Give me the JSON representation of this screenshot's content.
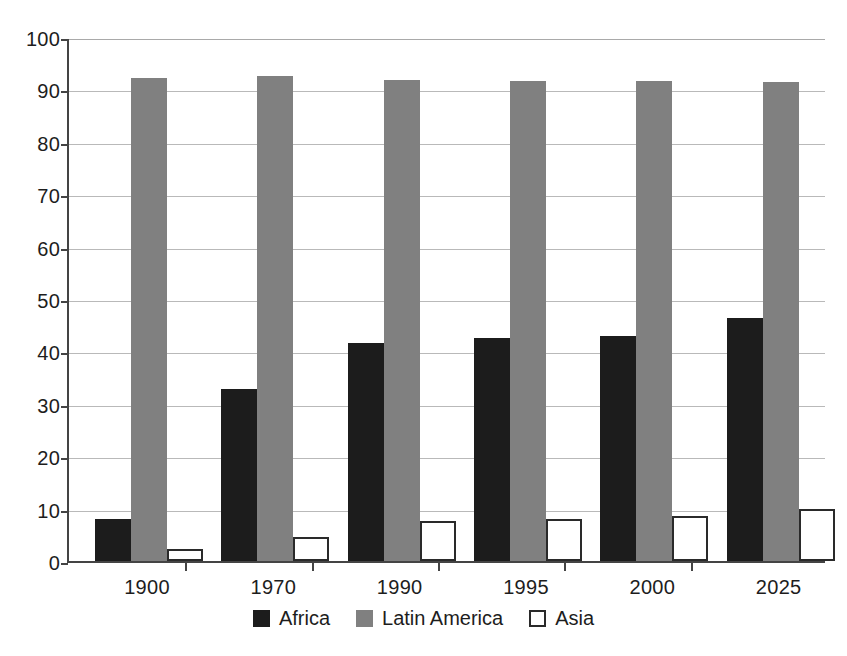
{
  "chart_data": {
    "type": "bar",
    "title": "",
    "subtitle": "",
    "xlabel": "",
    "ylabel": "",
    "categories": [
      "1900",
      "1970",
      "1990",
      "1995",
      "2000",
      "2025"
    ],
    "series": [
      {
        "name": "Africa",
        "color": "#1c1c1c",
        "values": [
          8,
          32.8,
          41.6,
          42.5,
          43,
          46.4
        ]
      },
      {
        "name": "Latin America",
        "color": "#808080",
        "values": [
          92.1,
          92.5,
          91.8,
          91.7,
          91.7,
          91.4
        ]
      },
      {
        "name": "Asia",
        "color": "#ffffff",
        "values": [
          2.2,
          4.5,
          7.7,
          8.1,
          8.5,
          9.9
        ]
      }
    ],
    "ylim": [
      0,
      100
    ],
    "ytick_labels": [
      "100",
      "90",
      "80",
      "70",
      "60",
      "50",
      "40",
      "30",
      "20",
      "10",
      "0"
    ],
    "ytick_values": [
      100,
      90,
      80,
      70,
      60,
      50,
      40,
      30,
      20,
      10,
      0
    ],
    "grid": true,
    "grid_axis": "y",
    "legend_position": "bottom-center",
    "axis_color": "#444444",
    "grid_color": "#b9b9b9",
    "background": "#ffffff"
  }
}
